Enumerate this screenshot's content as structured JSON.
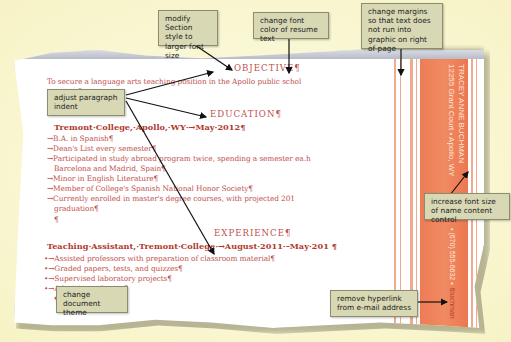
{
  "ribbon": {
    "group_label": "Font"
  },
  "resume": {
    "objective": {
      "heading": "OBJECTIVE¶",
      "lines": [
        "To secure a language arts teaching position in the Apollo public schol",
        "system. ¶",
        "¶"
      ]
    },
    "education": {
      "heading": "EDUCATION¶",
      "school_line": "Tremont·College,·Apollo,·WY·→May·2012¶",
      "items": [
        "B.A. in Spanish¶",
        "Dean's List every semester¶",
        "Participated in study abroad program twice, spending a semester ea.h",
        "Barcelona and Madrid, Spain¶",
        "Minor in English Literature¶",
        "Member of College's Spanish National Honor Society¶",
        "Currently enrolled in master's degree courses, with projected 201",
        "graduation¶",
        "¶"
      ]
    },
    "experience": {
      "heading": "EXPERIENCE¶",
      "job_line": "Teaching·Assistant,·Tremont·College·→August·2011·–May·201 ¶",
      "items": [
        "Assisted professors with preparation of classroom material¶",
        "Graded papers, tests, and quizzes¶",
        "Supervised laboratory projects¶",
        "Administered tests¶",
        "¶"
      ]
    },
    "sidebar": {
      "name": "TRACEY ANNE BUCHMAN",
      "address": "12255 Grant Court • Apollo, WY",
      "phone": "• (670) 555-6632 •",
      "email": "tbuchman"
    }
  },
  "callouts": {
    "section_style": "modify Section style to larger font size",
    "font_color": "change font color of resume text",
    "margins": "change margins so that text does not run into graphic on right of page",
    "paragraph_indent": "adjust paragraph indent",
    "name_font_size": "increase font size of name content control",
    "document_theme": "change document theme",
    "hyperlink": "remove hyperlink from e-mail address"
  },
  "colors": {
    "callout_bg": "#d9d8b4",
    "resume_text": "#c0504d",
    "accent_orange": "#ee7c55",
    "background": "#fbf9d8"
  }
}
